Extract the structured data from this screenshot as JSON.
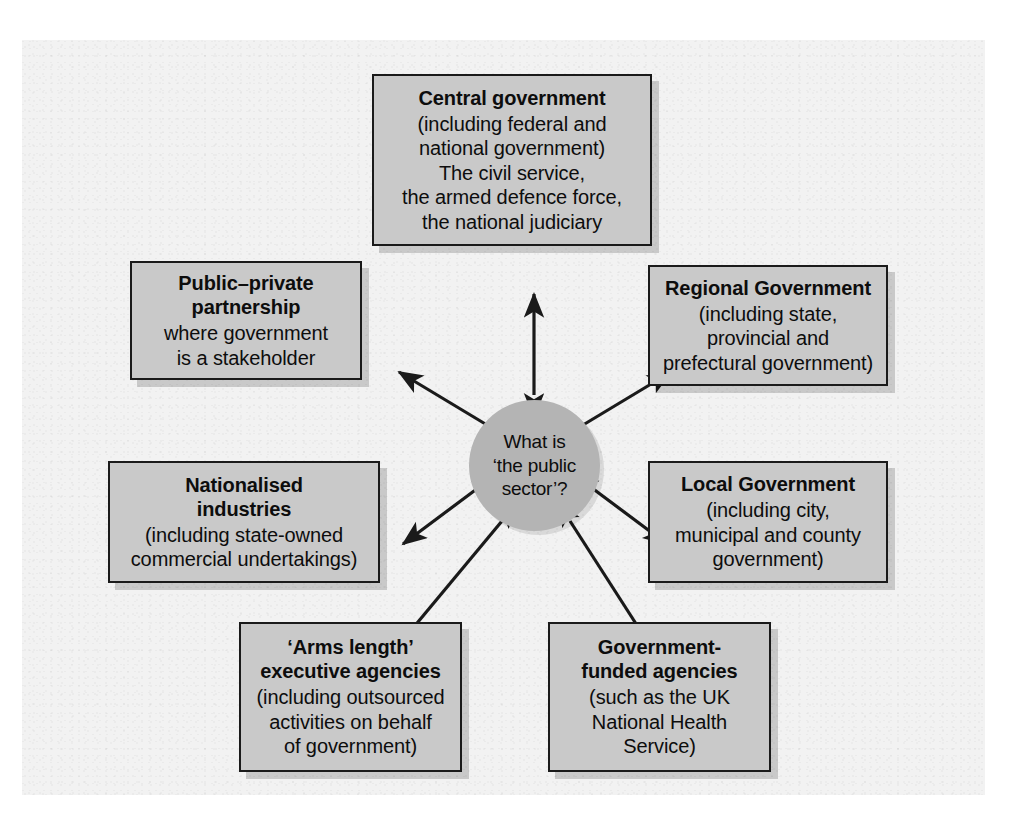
{
  "figure": {
    "hub": {
      "name": "public-sector-question",
      "text": "What is\n‘the public\nsector’?"
    },
    "nodes": [
      {
        "id": "central-government",
        "title": "Central government",
        "body": "(including federal and\nnational government)\nThe civil service,\nthe armed defence force,\nthe national judiciary"
      },
      {
        "id": "public-private-partnership",
        "title": "Public–private\npartnership",
        "body": "where government\nis a stakeholder"
      },
      {
        "id": "regional-government",
        "title": "Regional Government",
        "body": "(including state,\nprovincial and\nprefectural government)"
      },
      {
        "id": "nationalised-industries",
        "title": "Nationalised\nindustries",
        "body": "(including state-owned\ncommercial undertakings)"
      },
      {
        "id": "local-government",
        "title": "Local Government",
        "body": "(including city,\nmunicipal and county\ngovernment)"
      },
      {
        "id": "arms-length-executive-agencies",
        "title": "‘Arms length’\nexecutive agencies",
        "body": "(including outsourced\nactivities on behalf\nof government)"
      },
      {
        "id": "government-funded-agencies",
        "title": "Government-\nfunded agencies",
        "body": "(such as the UK\nNational Health\nService)"
      }
    ],
    "connectors": [
      {
        "id": "hub-to-central-government",
        "style": "double-headed-arrow"
      },
      {
        "id": "hub-to-public-private-partnership",
        "style": "double-headed-arrow"
      },
      {
        "id": "hub-to-regional-government",
        "style": "double-headed-arrow"
      },
      {
        "id": "hub-to-nationalised-industries",
        "style": "double-headed-arrow"
      },
      {
        "id": "hub-to-local-government",
        "style": "double-headed-arrow"
      },
      {
        "id": "hub-to-arms-length-executive-agencies",
        "style": "double-headed-arrow"
      },
      {
        "id": "hub-to-government-funded-agencies",
        "style": "double-headed-arrow"
      }
    ],
    "colors": {
      "page_background": "#ffffff",
      "panel_background": "#f2f2f2",
      "box_fill": "#c9c9c9",
      "box_border": "#1a1a1a",
      "hub_fill": "#b4b4b4",
      "text": "#0d0d0d",
      "arrow": "#1a1a1a"
    }
  }
}
